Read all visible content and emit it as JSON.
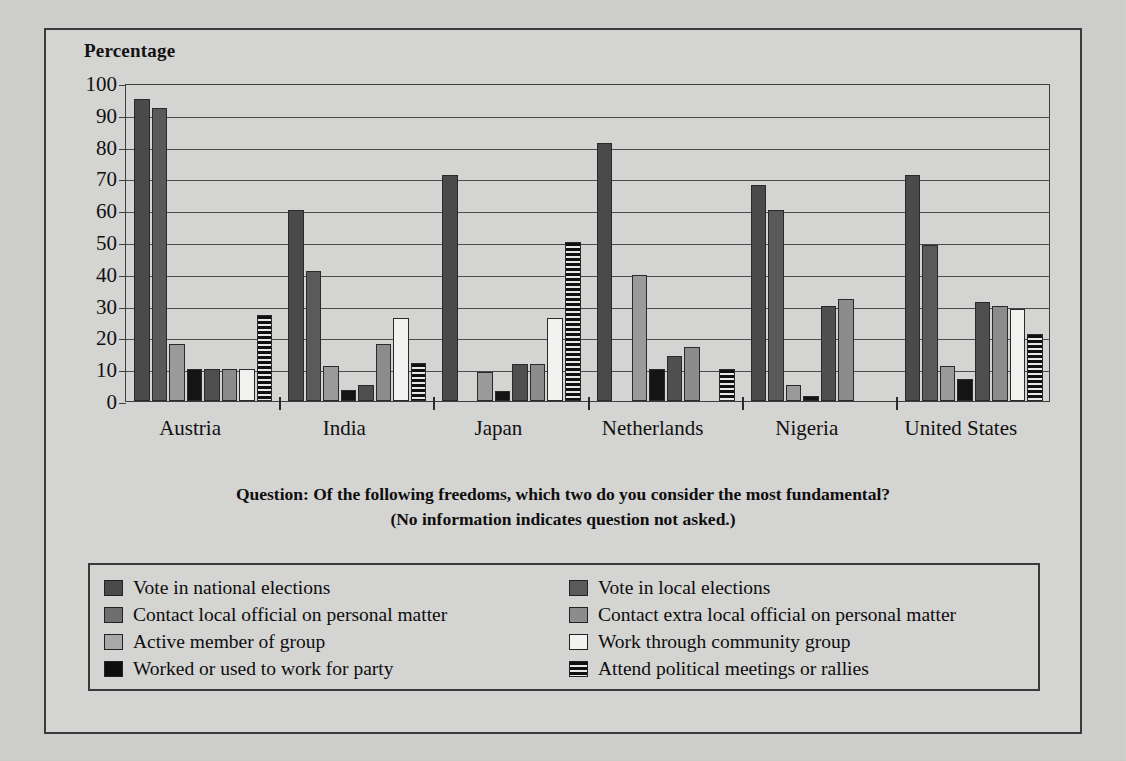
{
  "chart_data": {
    "type": "bar",
    "title": "",
    "ylabel": "Percentage",
    "xlabel": "",
    "ylim": [
      0,
      100
    ],
    "ytick_step": 10,
    "yticks": [
      100,
      90,
      80,
      70,
      60,
      50,
      40,
      30,
      20,
      10,
      0
    ],
    "grid": true,
    "legend_position": "below-plot",
    "categories": [
      "Austria",
      "India",
      "Japan",
      "Netherlands",
      "Nigeria",
      "United States"
    ],
    "series": [
      {
        "name": "Vote in national elections",
        "color": "#4a4a4a",
        "pattern": "solid",
        "values": [
          95,
          60,
          71,
          81,
          68,
          71
        ]
      },
      {
        "name": "Vote in local elections",
        "color": "#5a5a5a",
        "pattern": "solid",
        "values": [
          92,
          41,
          null,
          null,
          60,
          49
        ]
      },
      {
        "name": "Contact local official on personal matter",
        "color": "#9a9a9a",
        "pattern": "solid",
        "values": [
          18,
          11,
          9,
          39.5,
          5,
          11
        ]
      },
      {
        "name": "Contact extra local official on personal matter",
        "color": "#141414",
        "pattern": "solid",
        "values": [
          10,
          3.5,
          3,
          10,
          1.5,
          7
        ]
      },
      {
        "name": "Active member of group",
        "color": "#4f4f4f",
        "pattern": "solid",
        "values": [
          10,
          5,
          11.5,
          14,
          30,
          31
        ]
      },
      {
        "name": "Work through community group",
        "color": "#8c8c8c",
        "pattern": "solid",
        "values": [
          10,
          18,
          11.5,
          17,
          32,
          30
        ]
      },
      {
        "name": "Worked or used to work for party",
        "color": "#f2f2f0",
        "pattern": "solid",
        "values": [
          10,
          26,
          26,
          null,
          null,
          29
        ]
      },
      {
        "name": "Attend political meetings or rallies",
        "color": "#111111",
        "pattern": "hatch",
        "values": [
          27,
          12,
          50,
          10,
          null,
          21
        ]
      }
    ],
    "legend": [
      {
        "label": "Vote in national elections",
        "color": "#4a4a4a",
        "pattern": "solid"
      },
      {
        "label": "Vote in local elections",
        "color": "#5a5a5a",
        "pattern": "solid"
      },
      {
        "label": "Contact local official on personal matter",
        "color": "#6e6e6e",
        "pattern": "solid"
      },
      {
        "label": "Contact extra local official on personal matter",
        "color": "#8c8c8c",
        "pattern": "solid"
      },
      {
        "label": "Active member of group",
        "color": "#a8a8a8",
        "pattern": "solid"
      },
      {
        "label": "Work through community group",
        "color": "#f2f2f0",
        "pattern": "solid"
      },
      {
        "label": "Worked or used to work for party",
        "color": "#0e0e0e",
        "pattern": "solid"
      },
      {
        "label": "Attend political meetings or rallies",
        "color": "#111111",
        "pattern": "hatch"
      }
    ],
    "caption_line1": "Question: Of the following freedoms, which two do you consider the most fundamental?",
    "caption_line2": "(No information indicates question not asked.)"
  }
}
